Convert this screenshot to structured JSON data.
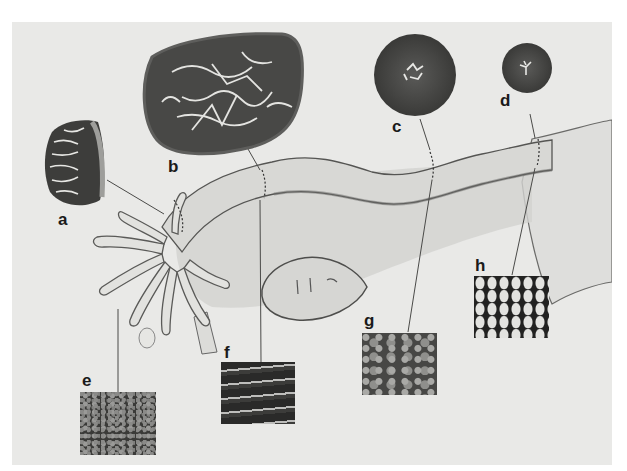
{
  "figure": {
    "colors": {
      "panel_background": "#e9e9e7",
      "drawing_line": "#555553",
      "section_tissue_dark": "#3d3d3b",
      "label_text": "#1a1a1a"
    },
    "cross_sections": [
      {
        "label": "a",
        "region": "infundibulum",
        "shape": "irregular-oval",
        "appearance": "highly folded mucosa"
      },
      {
        "label": "b",
        "region": "ampulla",
        "shape": "large-oval",
        "appearance": "extensively branched mucosal folds"
      },
      {
        "label": "c",
        "region": "isthmus",
        "shape": "circle",
        "appearance": "thick muscular wall, small lumen"
      },
      {
        "label": "d",
        "region": "intramural (uterine) part",
        "shape": "small-circle",
        "appearance": "narrow stellate lumen"
      }
    ],
    "micrographs": [
      {
        "label": "e",
        "region": "fimbriae"
      },
      {
        "label": "f",
        "region": "ampulla"
      },
      {
        "label": "g",
        "region": "isthmus"
      },
      {
        "label": "h",
        "region": "uterine portion"
      }
    ],
    "labels": {
      "a": "a",
      "b": "b",
      "c": "c",
      "d": "d",
      "e": "e",
      "f": "f",
      "g": "g",
      "h": "h"
    }
  }
}
